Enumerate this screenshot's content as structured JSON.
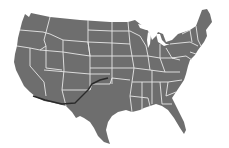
{
  "image": {
    "description": "Grayscale map of the contiguous United States with white state borders and a dark route line across the southwest",
    "colors": {
      "background": "#ffffff",
      "land": "#6e6e6e",
      "borders": "#e8e8e8",
      "route": "#2a2a2a"
    }
  },
  "map": {
    "subject": "Contiguous United States",
    "route": {
      "label": "Southwest route",
      "points": [
        [
          33,
          96
        ],
        [
          45,
          100
        ],
        [
          62,
          104
        ],
        [
          75,
          103
        ],
        [
          82,
          96
        ],
        [
          88,
          90
        ],
        [
          92,
          84
        ],
        [
          100,
          80
        ],
        [
          108,
          78
        ]
      ]
    }
  }
}
